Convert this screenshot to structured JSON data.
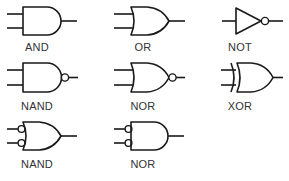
{
  "gates": [
    {
      "id": "and",
      "label": "AND",
      "symbol": "and-gate"
    },
    {
      "id": "or",
      "label": "OR",
      "symbol": "or-gate"
    },
    {
      "id": "not",
      "label": "NOT",
      "symbol": "not-gate"
    },
    {
      "id": "nand",
      "label": "NAND",
      "symbol": "nand-gate"
    },
    {
      "id": "nor",
      "label": "NOR",
      "symbol": "nor-gate"
    },
    {
      "id": "xor",
      "label": "XOR",
      "symbol": "xor-gate"
    },
    {
      "id": "nand-alt",
      "label": "NAND",
      "symbol": "or-gate-with-inverted-inputs"
    },
    {
      "id": "nor-alt",
      "label": "NOR",
      "symbol": "and-gate-with-inverted-inputs"
    }
  ]
}
